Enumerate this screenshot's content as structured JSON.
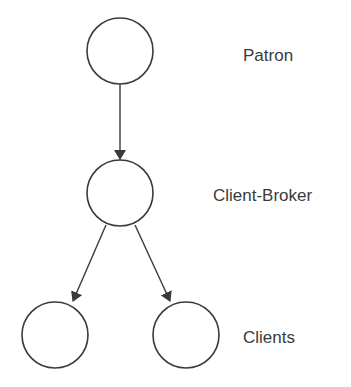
{
  "diagram": {
    "nodes": [
      {
        "id": "patron",
        "cx": 120,
        "cy": 51,
        "r": 33
      },
      {
        "id": "client-broker",
        "cx": 120,
        "cy": 193,
        "r": 33
      },
      {
        "id": "client-left",
        "cx": 55,
        "cy": 335,
        "r": 33
      },
      {
        "id": "client-right",
        "cx": 186,
        "cy": 335,
        "r": 33
      }
    ],
    "edges": [
      {
        "from": "patron",
        "to": "client-broker"
      },
      {
        "from": "client-broker",
        "to": "client-left"
      },
      {
        "from": "client-broker",
        "to": "client-right"
      }
    ],
    "labels": {
      "patron": "Patron",
      "client_broker": "Client-Broker",
      "clients": "Clients"
    },
    "colors": {
      "stroke": "#3a3a3a",
      "background": "#ffffff"
    }
  }
}
